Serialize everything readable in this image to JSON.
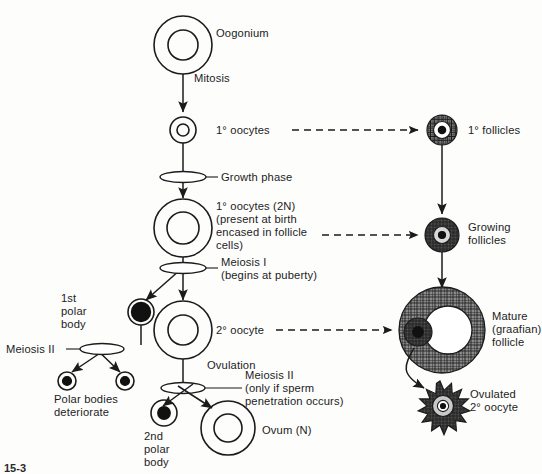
{
  "figure": {
    "caption": "15-3",
    "background_color": "#fdfdfc",
    "ink_color": "#1b1b1b"
  },
  "left_column": {
    "name": "oogenesis-pathway",
    "stages": [
      {
        "id": "oogonium",
        "label": "Oogonium",
        "cell_type": "double-circle",
        "x": 183,
        "y": 45,
        "outer_r": 29,
        "inner_r": 15
      },
      {
        "id": "primary-oocyte",
        "label": "1° oocytes",
        "cell_type": "double-circle",
        "x": 183,
        "y": 130,
        "outer_r": 13,
        "inner_r": 6
      },
      {
        "id": "primary-oocyte-2n",
        "label": "1° oocytes (2N)",
        "cell_type": "double-circle",
        "x": 183,
        "y": 228,
        "outer_r": 29,
        "inner_r": 16
      },
      {
        "id": "secondary-oocyte",
        "label": "2° oocyte",
        "cell_type": "double-circle",
        "x": 183,
        "y": 330,
        "outer_r": 29,
        "inner_r": 15
      },
      {
        "id": "ovum",
        "label": "Ovum (N)",
        "cell_type": "double-circle",
        "x": 228,
        "y": 428,
        "outer_r": 27,
        "inner_r": 14
      }
    ],
    "notes": {
      "primary_oocyte_2n_detail": [
        "1° oocytes (2N)",
        "(present at birth",
        "encased in follicle",
        "cells)"
      ]
    },
    "processes": [
      {
        "id": "mitosis",
        "label": "Mitosis",
        "x": 196,
        "y": 82
      },
      {
        "id": "growth",
        "label": "Growth phase",
        "x": 222,
        "y": 178,
        "marker": "ellipse"
      },
      {
        "id": "meiosis-1",
        "label": "Meiosis I",
        "sublabel": "(begins at puberty)",
        "x": 222,
        "y": 268,
        "marker": "ellipse"
      },
      {
        "id": "ovulation",
        "label": "Ovulation",
        "x": 210,
        "y": 368
      },
      {
        "id": "meiosis-2-right",
        "label": "Meiosis II",
        "sublabel_lines": [
          "(only if sperm",
          "penetration occurs)"
        ],
        "x": 248,
        "y": 374,
        "marker": "ellipse"
      },
      {
        "id": "meiosis-2-left",
        "label": "Meiosis II",
        "x": 8,
        "y": 355,
        "marker": "ellipse"
      }
    ]
  },
  "polar_bodies": {
    "first": {
      "id": "first-polar-body",
      "label_lines": [
        "1st",
        "polar",
        "body"
      ],
      "cell_type": "filled-circle",
      "x": 141,
      "y": 312,
      "r": 13
    },
    "deteriorating": {
      "id": "polar-bodies-deteriorate",
      "label_lines": [
        "Polar bodies",
        "deteriorate"
      ],
      "cells": [
        {
          "x": 67,
          "y": 381,
          "r": 9
        },
        {
          "x": 125,
          "y": 381,
          "r": 9
        }
      ]
    },
    "second": {
      "id": "second-polar-body",
      "label_lines": [
        "2nd",
        "polar",
        "body"
      ],
      "cell_type": "dot-circle",
      "x": 164,
      "y": 413,
      "r": 13
    }
  },
  "right_column": {
    "name": "folliculogenesis-pathway",
    "stages": [
      {
        "id": "primary-follicle",
        "label_lines": [
          "1° follicles"
        ],
        "x": 442,
        "y": 130,
        "r": 15
      },
      {
        "id": "growing-follicle",
        "label_lines": [
          "Growing",
          "follicles"
        ],
        "x": 442,
        "y": 235,
        "r": 17
      },
      {
        "id": "mature-follicle",
        "label_lines": [
          "Mature",
          "(graafian)",
          "follicle"
        ],
        "x": 442,
        "y": 330,
        "r": 43
      },
      {
        "id": "ovulated-oocyte",
        "label_lines": [
          "Ovulated",
          "2° oocyte"
        ],
        "x": 440,
        "y": 398,
        "r": 16
      }
    ]
  },
  "connectors": {
    "dashed": [
      {
        "id": "link-primary-oocyte-to-follicle",
        "from": "1° oocytes",
        "to": "1° follicles"
      },
      {
        "id": "link-oocyte2n-to-growing",
        "from": "1° oocytes (2N)",
        "to": "Growing follicles"
      },
      {
        "id": "link-secondary-to-mature",
        "from": "2° oocyte",
        "to": "Mature (graafian) follicle"
      }
    ]
  }
}
